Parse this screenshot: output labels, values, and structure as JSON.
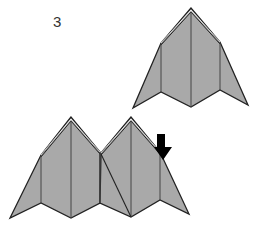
{
  "diagram": {
    "step_number": "3",
    "colors": {
      "paper_fill": "#a9a9a9",
      "stroke": "#222222",
      "crease": "#444444",
      "arrow": "#000000",
      "background": "#ffffff"
    },
    "figures": [
      {
        "name": "single-folded-unit",
        "description": "Folded paper unit, top view"
      },
      {
        "name": "two-joined-units",
        "description": "Two folded units joined, arrow indicating next fold"
      }
    ],
    "arrow": {
      "direction": "down",
      "meaning": "fold/push down"
    }
  }
}
